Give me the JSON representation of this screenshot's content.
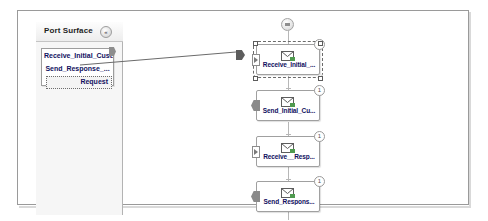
{
  "panel": {
    "title": "Port Surface",
    "collapse_icon": "chevron-double-left-icon",
    "collapse_glyph": "«"
  },
  "port_box": {
    "port_type": "Receive_Initial_Cust...",
    "operation": "Send_Response_...",
    "message": "Request",
    "handle_icon": "connector-handle-icon"
  },
  "orchestration": {
    "begin_node_icon": "begin-shape-icon",
    "shapes": [
      {
        "label": "Receive_Initial_...",
        "icon": "receive-envelope-icon",
        "badge": "1",
        "port_marker": "inbound-port-icon",
        "selected": true
      },
      {
        "label": "Send_Initial_Cu...",
        "icon": "send-envelope-icon",
        "badge": "1",
        "port_marker": "outbound-port-icon",
        "selected": false
      },
      {
        "label": "Receive__Resp...",
        "icon": "receive-envelope-icon",
        "badge": "1",
        "port_marker": "inbound-port-icon",
        "selected": false
      },
      {
        "label": "Send_Respons...",
        "icon": "send-envelope-icon",
        "badge": "1",
        "port_marker": "outbound-port-icon",
        "selected": false
      }
    ]
  },
  "connector": {
    "name": "port-to-shape-connector",
    "arrow_icon": "arrow-right-icon"
  },
  "colors": {
    "canvas_border": "#9a9a9a",
    "panel_background": "#f6f6f6",
    "shape_label": "#0f0f60",
    "spine": "#b7b7b7"
  }
}
